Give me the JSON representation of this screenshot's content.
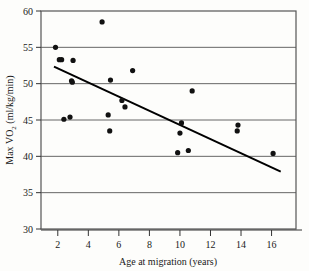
{
  "chart_data": {
    "type": "scatter",
    "title": "",
    "xlabel": "Age at migration (years)",
    "ylabel": "Max VO2 (ml/kg/min)",
    "ylabel_prefix": "Max VO",
    "ylabel_sub": "2",
    "ylabel_suffix": " (ml/kg/min)",
    "xlim": [
      0.9,
      17.6
    ],
    "ylim": [
      30,
      60
    ],
    "xticks": [
      2,
      4,
      6,
      8,
      10,
      12,
      14,
      16
    ],
    "yticks": [
      30,
      35,
      40,
      45,
      50,
      55,
      60
    ],
    "grid": "horizontal",
    "legend": "none",
    "marker": "filled-circle",
    "marker_color": "#111111",
    "line_color": "#000000",
    "frame_color": "#555555",
    "points": [
      {
        "x": 1.85,
        "y": 55.0
      },
      {
        "x": 2.1,
        "y": 53.3
      },
      {
        "x": 2.25,
        "y": 53.3
      },
      {
        "x": 2.4,
        "y": 45.1
      },
      {
        "x": 2.8,
        "y": 45.4
      },
      {
        "x": 2.9,
        "y": 50.4
      },
      {
        "x": 2.95,
        "y": 50.2
      },
      {
        "x": 3.0,
        "y": 53.2
      },
      {
        "x": 4.9,
        "y": 58.5
      },
      {
        "x": 5.3,
        "y": 45.7
      },
      {
        "x": 5.4,
        "y": 43.5
      },
      {
        "x": 5.45,
        "y": 50.5
      },
      {
        "x": 6.2,
        "y": 47.7
      },
      {
        "x": 6.4,
        "y": 46.8
      },
      {
        "x": 6.9,
        "y": 51.8
      },
      {
        "x": 9.85,
        "y": 40.5
      },
      {
        "x": 10.0,
        "y": 43.2
      },
      {
        "x": 10.1,
        "y": 44.6
      },
      {
        "x": 10.55,
        "y": 40.8
      },
      {
        "x": 10.8,
        "y": 49.0
      },
      {
        "x": 13.75,
        "y": 43.5
      },
      {
        "x": 13.8,
        "y": 44.3
      },
      {
        "x": 16.1,
        "y": 40.4
      }
    ],
    "trend_line": {
      "x_start": 1.75,
      "y_start": 52.35,
      "x_end": 16.6,
      "y_end": 37.9,
      "label": "regression-line"
    }
  }
}
